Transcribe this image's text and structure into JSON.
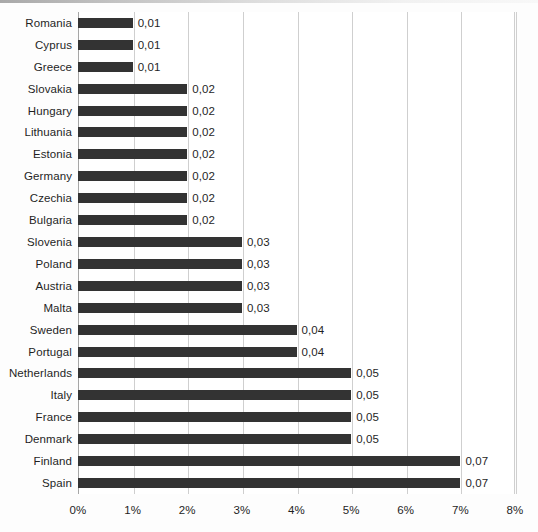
{
  "chart_data": {
    "type": "bar",
    "orientation": "horizontal",
    "title": "",
    "subtitle": "",
    "xlabel": "",
    "ylabel": "",
    "xlim": [
      0,
      0.08
    ],
    "grid": true,
    "legend": null,
    "value_format": "comma-decimal",
    "xtick_labels": [
      "0%",
      "1%",
      "2%",
      "3%",
      "4%",
      "5%",
      "6%",
      "7%",
      "8%"
    ],
    "xtick_values": [
      0,
      0.01,
      0.02,
      0.03,
      0.04,
      0.05,
      0.06,
      0.07,
      0.08
    ],
    "categories": [
      "Romania",
      "Cyprus",
      "Greece",
      "Slovakia",
      "Hungary",
      "Lithuania",
      "Estonia",
      "Germany",
      "Czechia",
      "Bulgaria",
      "Slovenia",
      "Poland",
      "Austria",
      "Malta",
      "Sweden",
      "Portugal",
      "Netherlands",
      "Italy",
      "France",
      "Denmark",
      "Finland",
      "Spain"
    ],
    "values": [
      0.01,
      0.01,
      0.01,
      0.02,
      0.02,
      0.02,
      0.02,
      0.02,
      0.02,
      0.02,
      0.03,
      0.03,
      0.03,
      0.03,
      0.04,
      0.04,
      0.05,
      0.05,
      0.05,
      0.05,
      0.07,
      0.07
    ],
    "data_labels": [
      "0,01",
      "0,01",
      "0,01",
      "0,02",
      "0,02",
      "0,02",
      "0,02",
      "0,02",
      "0,02",
      "0,02",
      "0,03",
      "0,03",
      "0,03",
      "0,03",
      "0,04",
      "0,04",
      "0,05",
      "0,05",
      "0,05",
      "0,05",
      "0,07",
      "0,07"
    ],
    "bar_color": "#333333",
    "gridline_color": "#cfcfcf",
    "axis_color": "#a6a6a6",
    "background_color": "#ffffff"
  }
}
